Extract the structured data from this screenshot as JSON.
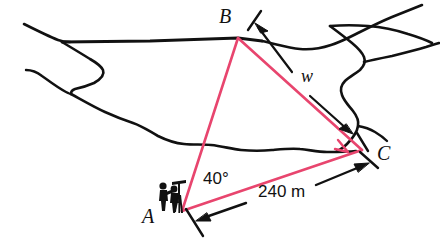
{
  "figure": {
    "type": "surveying-triangle-diagram",
    "title": "",
    "background_color": "#ffffff",
    "ink_color": "#111111",
    "triangle_color": "#E8456E"
  },
  "labels": {
    "vertex_a": "A",
    "vertex_b": "B",
    "vertex_c": "C",
    "unknown_side": "w",
    "angle_at_a": "40°",
    "known_side": "240 m"
  },
  "icons": {
    "surveyor": "surveyor-figures-icon",
    "right_angle": "right-angle-marker-icon",
    "shoreline": "shoreline-icon"
  },
  "geometry": {
    "points": {
      "A": [
        182,
        211
      ],
      "B": [
        238,
        38
      ],
      "C": [
        362,
        150
      ]
    },
    "right_angle_vertex": "C",
    "measured_side": "AC",
    "measured_value": "240 m",
    "measured_angle_vertex": "A",
    "measured_angle_value": "40°",
    "unknown_side_label": "w",
    "unknown_side_endpoints": "BC"
  }
}
